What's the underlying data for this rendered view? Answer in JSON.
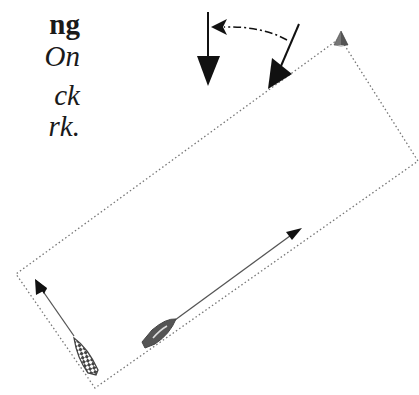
{
  "text": {
    "title_fragment": "ng",
    "lines": [
      "On",
      "ck",
      "rk."
    ]
  },
  "diagram": {
    "elements": {
      "wind_old": "wind-arrow",
      "wind_new": "wind-arrow",
      "wind_shift": "dash-dot-curved-arrow",
      "mark": "mark-buoy",
      "course_area": "dotted-rectangle",
      "boat_left": "checkered-boat",
      "boat_right": "gray-boat"
    },
    "colors": {
      "ink": "#111111",
      "boat_gray": "#555555",
      "mark_gray": "#666666",
      "dotted": "#777777"
    }
  }
}
